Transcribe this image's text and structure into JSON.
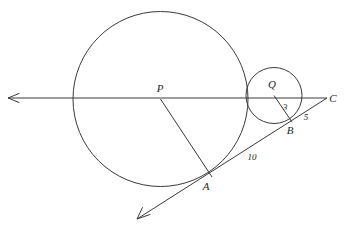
{
  "figure": {
    "type": "geometry-diagram",
    "background_color": "#ffffff",
    "stroke_color": "#3a3a3a",
    "text_color": "#262626",
    "width": 345,
    "height": 228
  },
  "labels": {
    "center_large": "P",
    "center_small": "Q",
    "tangent_point_large": "A",
    "tangent_point_small": "B",
    "external_point": "C",
    "radius_small": "3",
    "segment_bc": "5",
    "segment_ac": "10"
  },
  "label_positions": {
    "P": {
      "x": 160,
      "y": 92
    },
    "Q": {
      "x": 272,
      "y": 88
    },
    "A": {
      "x": 206,
      "y": 190
    },
    "B": {
      "x": 288,
      "y": 133
    },
    "C": {
      "x": 331,
      "y": 102
    },
    "three": {
      "x": 284,
      "y": 108
    },
    "five": {
      "x": 305,
      "y": 119
    },
    "ten": {
      "x": 250,
      "y": 160
    }
  },
  "geometry": {
    "circle_large": {
      "cx": 160.5,
      "cy": 99,
      "r": 87.5
    },
    "circle_small": {
      "cx": 274,
      "cy": 95.5,
      "r": 28
    },
    "point_P": {
      "x": 160.5,
      "y": 99
    },
    "point_Q": {
      "x": 274,
      "y": 95.5
    },
    "point_A": {
      "x": 212,
      "y": 177
    },
    "point_B": {
      "x": 292,
      "y": 122
    },
    "point_C": {
      "x": 327,
      "y": 98
    },
    "line_of_centers": {
      "x1": 8,
      "y1": 98,
      "x2": 327,
      "y2": 98
    },
    "tangent_line": {
      "x1": 137,
      "y1": 219,
      "x2": 327,
      "y2": 98
    },
    "radius_PA": {
      "x1": 160.5,
      "y1": 99,
      "x2": 212,
      "y2": 177
    },
    "radius_QB": {
      "x1": 274,
      "y1": 95.5,
      "x2": 292,
      "y2": 122
    },
    "arrow_left": {
      "tip_x": 8,
      "tip_y": 98
    },
    "arrow_lower_left": {
      "tip_x": 137,
      "tip_y": 219
    }
  },
  "measurements": [
    {
      "segment": "QB",
      "value": "3",
      "meaning": "radius of small circle"
    },
    {
      "segment": "BC",
      "value": "5",
      "meaning": "tangent segment from B to C"
    },
    {
      "segment": "AC",
      "value": "10",
      "meaning": "tangent segment from A to C"
    }
  ]
}
